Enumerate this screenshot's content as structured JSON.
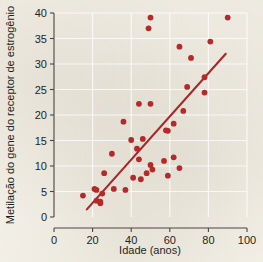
{
  "chart_data": {
    "type": "scatter",
    "title": "",
    "xlabel": "Idade (anos)",
    "ylabel": "Metilação do gene do receptor de estrogênio",
    "xlim": [
      0,
      100
    ],
    "ylim": [
      0,
      40
    ],
    "xticks": [
      0,
      20,
      40,
      60,
      80,
      100
    ],
    "yticks": [
      0,
      5,
      10,
      15,
      20,
      25,
      30,
      35,
      40
    ],
    "grid": true,
    "legend": "none",
    "marker_color": "#b5292b",
    "line_color": "#a8282a",
    "background_color": "#f2efe6",
    "axis_color": "#4a4541",
    "points": [
      {
        "x": 15,
        "y": 4.2
      },
      {
        "x": 21,
        "y": 5.5
      },
      {
        "x": 22,
        "y": 5.3
      },
      {
        "x": 22,
        "y": 3.2
      },
      {
        "x": 24,
        "y": 3.0
      },
      {
        "x": 24,
        "y": 2.7
      },
      {
        "x": 25,
        "y": 4.6
      },
      {
        "x": 26,
        "y": 8.6
      },
      {
        "x": 30,
        "y": 12.4
      },
      {
        "x": 31,
        "y": 5.5
      },
      {
        "x": 36,
        "y": 18.7
      },
      {
        "x": 37,
        "y": 5.3
      },
      {
        "x": 40,
        "y": 15.1
      },
      {
        "x": 41,
        "y": 7.7
      },
      {
        "x": 43,
        "y": 13.4
      },
      {
        "x": 44,
        "y": 11.3
      },
      {
        "x": 44,
        "y": 22.2
      },
      {
        "x": 45,
        "y": 7.4
      },
      {
        "x": 46,
        "y": 15.3
      },
      {
        "x": 48,
        "y": 8.6
      },
      {
        "x": 49,
        "y": 37.0
      },
      {
        "x": 50,
        "y": 10.2
      },
      {
        "x": 50,
        "y": 39.1
      },
      {
        "x": 50,
        "y": 22.2
      },
      {
        "x": 51,
        "y": 9.3
      },
      {
        "x": 57,
        "y": 11.0
      },
      {
        "x": 58,
        "y": 17.0
      },
      {
        "x": 59,
        "y": 16.9
      },
      {
        "x": 59,
        "y": 8.1
      },
      {
        "x": 62,
        "y": 18.3
      },
      {
        "x": 62,
        "y": 11.7
      },
      {
        "x": 65,
        "y": 33.4
      },
      {
        "x": 65,
        "y": 9.6
      },
      {
        "x": 67,
        "y": 20.8
      },
      {
        "x": 69,
        "y": 25.5
      },
      {
        "x": 71,
        "y": 31.2
      },
      {
        "x": 78,
        "y": 24.4
      },
      {
        "x": 78,
        "y": 27.4
      },
      {
        "x": 81,
        "y": 34.4
      },
      {
        "x": 90,
        "y": 39.1
      }
    ],
    "trendline": {
      "x0": 17,
      "y0": 1.5,
      "x1": 89,
      "y1": 32.0
    }
  }
}
